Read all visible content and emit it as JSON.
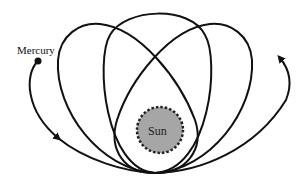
{
  "diagram": {
    "type": "orbital-precession",
    "labels": {
      "planet": "Mercury",
      "star": "Sun"
    },
    "colors": {
      "background": "#ffffff",
      "orbit_stroke": "#111111",
      "sun_fill": "#a6a6a6",
      "sun_border": "#222222",
      "planet_fill": "#111111"
    },
    "elements": {
      "orbits": [
        {
          "name": "orbit-left",
          "tilt_deg": -28
        },
        {
          "name": "orbit-center",
          "tilt_deg": 0
        },
        {
          "name": "orbit-right",
          "tilt_deg": 28
        }
      ],
      "arrows": [
        {
          "name": "precession-arrow-left",
          "direction": "clockwise-down"
        },
        {
          "name": "precession-arrow-right",
          "direction": "up"
        }
      ],
      "sun": {
        "style": "dashed-border-circle"
      },
      "planet": {
        "style": "filled-dot"
      }
    }
  }
}
